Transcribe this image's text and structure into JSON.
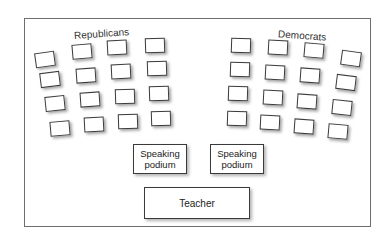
{
  "diagram": {
    "type": "classroom-seating-chart",
    "groups": [
      {
        "label": "Republicans",
        "rows": 4,
        "cols": 4
      },
      {
        "label": "Democrats",
        "rows": 4,
        "cols": 4
      }
    ],
    "podiums": [
      {
        "label_line1": "Speaking",
        "label_line2": "podium"
      },
      {
        "label_line1": "Speaking",
        "label_line2": "podium"
      }
    ],
    "teacher": {
      "label": "Teacher"
    },
    "colors": {
      "border": "#3a3a3a",
      "frame": "#6e6e6e",
      "background": "#ffffff"
    }
  }
}
